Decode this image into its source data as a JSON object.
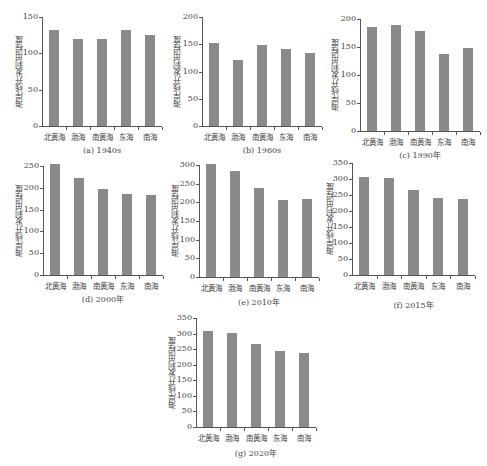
{
  "chart_data": [
    {
      "type": "bar",
      "title": "(a) 1940s",
      "xlabel": "",
      "ylabel": "海岸线开发利用程度",
      "categories": [
        "北黄海",
        "渤海",
        "南黄海",
        "东海",
        "南海"
      ],
      "values": [
        132,
        120,
        120,
        132,
        125
      ],
      "ylim": [
        0,
        150
      ],
      "yticks": [
        0,
        50,
        100,
        150
      ],
      "grid": false
    },
    {
      "type": "bar",
      "title": "(b) 1960s",
      "xlabel": "",
      "ylabel": "海岸线开发利用程度",
      "categories": [
        "北黄海",
        "渤海",
        "南黄海",
        "东海",
        "南海"
      ],
      "values": [
        153,
        122,
        149,
        141,
        134
      ],
      "ylim": [
        0,
        200
      ],
      "yticks": [
        0,
        50,
        100,
        150,
        200
      ],
      "grid": false
    },
    {
      "type": "bar",
      "title": "(c) 1990年",
      "xlabel": "",
      "ylabel": "海岸线开发利用程度",
      "categories": [
        "北黄海",
        "渤海",
        "南黄海",
        "东海",
        "南海"
      ],
      "values": [
        185,
        190,
        179,
        137,
        148
      ],
      "ylim": [
        0,
        200
      ],
      "yticks": [
        0,
        50,
        100,
        150,
        200
      ],
      "grid": false
    },
    {
      "type": "bar",
      "title": "(d) 2000年",
      "xlabel": "",
      "ylabel": "海岸线开发利用程度",
      "categories": [
        "北黄海",
        "渤海",
        "南黄海",
        "东海",
        "南海"
      ],
      "values": [
        255,
        223,
        197,
        186,
        184
      ],
      "ylim": [
        0,
        250
      ],
      "yticks": [
        0,
        50,
        100,
        150,
        200,
        250
      ],
      "grid": false
    },
    {
      "type": "bar",
      "title": "(e) 2010年",
      "xlabel": "",
      "ylabel": "海岸线开发利用程度",
      "categories": [
        "北黄海",
        "渤海",
        "南黄海",
        "东海",
        "南海"
      ],
      "values": [
        303,
        285,
        239,
        207,
        209
      ],
      "ylim": [
        0,
        300
      ],
      "yticks": [
        0,
        50,
        100,
        150,
        200,
        250,
        300
      ],
      "grid": false
    },
    {
      "type": "bar",
      "title": "(f) 2015年",
      "xlabel": "",
      "ylabel": "海岸线开发利用程度",
      "categories": [
        "北黄海",
        "渤海",
        "南黄海",
        "东海",
        "南海"
      ],
      "values": [
        306,
        303,
        265,
        242,
        239
      ],
      "ylim": [
        0,
        350
      ],
      "yticks": [
        0,
        50,
        100,
        150,
        200,
        250,
        300,
        350
      ],
      "grid": false
    },
    {
      "type": "bar",
      "title": "(g) 2020年",
      "xlabel": "",
      "ylabel": "海岸线开发利用程度",
      "categories": [
        "北黄海",
        "渤海",
        "南黄海",
        "东海",
        "南海"
      ],
      "values": [
        307,
        303,
        268,
        244,
        238
      ],
      "ylim": [
        0,
        350
      ],
      "yticks": [
        0,
        50,
        100,
        150,
        200,
        250,
        300,
        350
      ],
      "grid": false
    }
  ],
  "style": {
    "bar_color": "#8a8a8a",
    "axis_color": "#555555"
  }
}
